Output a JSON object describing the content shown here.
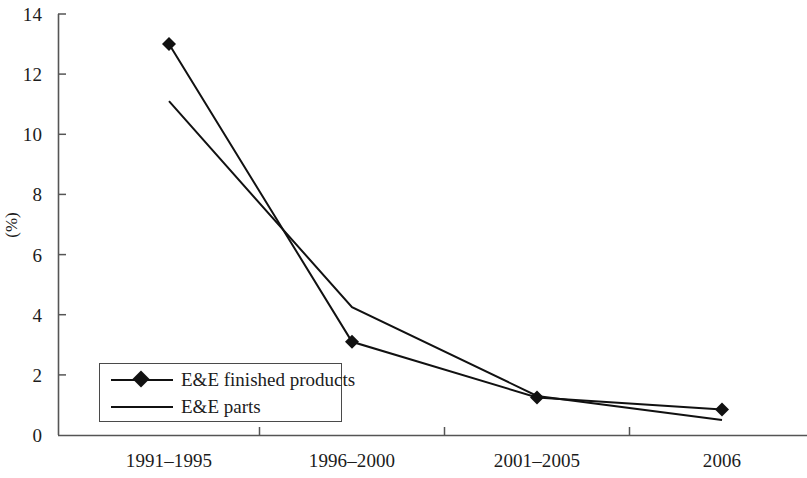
{
  "chart_data": {
    "type": "line",
    "title": "",
    "subtitle": "",
    "xlabel": "",
    "ylabel": "(%)",
    "categories": [
      "1991–1995",
      "1996–2000",
      "2001–2005",
      "2006"
    ],
    "series": [
      {
        "name": "E&E finished products",
        "values": [
          13.0,
          3.1,
          1.25,
          0.85
        ],
        "marker": "diamond",
        "color": "#111111"
      },
      {
        "name": "E&E parts",
        "values": [
          11.1,
          4.25,
          1.3,
          0.5
        ],
        "marker": "none",
        "color": "#111111"
      }
    ],
    "ylim": [
      0,
      14
    ],
    "ytick_values": [
      0,
      2,
      4,
      6,
      8,
      10,
      12,
      14
    ],
    "ytick_labels": [
      "0",
      "2",
      "4",
      "6",
      "8",
      "10",
      "12",
      "14"
    ],
    "grid": false,
    "legend_position": "inside-lower-left",
    "legend_entries": [
      "E&E finished products",
      "E&E parts"
    ],
    "axis_color": "#555555",
    "line_color": "#111111",
    "background": "#ffffff"
  }
}
